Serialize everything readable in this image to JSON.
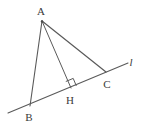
{
  "figure": {
    "type": "euclidean-geometry-diagram",
    "width": 145,
    "height": 132,
    "background_color": "#ffffff",
    "stroke_color": "#5a5a5a",
    "label_color": "#3a3a3a",
    "points": [
      {
        "id": "A",
        "label": "A",
        "x": 42,
        "y": 21,
        "label_x": 41,
        "label_y": 11
      },
      {
        "id": "B",
        "label": "B",
        "x": 30,
        "y": 106,
        "label_x": 29,
        "label_y": 117
      },
      {
        "id": "H",
        "label": "H",
        "x": 71,
        "y": 88,
        "label_x": 70,
        "label_y": 100
      },
      {
        "id": "C",
        "label": "C",
        "x": 106,
        "y": 72,
        "label_x": 107,
        "label_y": 84
      }
    ],
    "line": {
      "id": "l",
      "label": "l",
      "x1": 8,
      "y1": 113,
      "x2": 128,
      "y2": 63,
      "label_x": 131,
      "label_y": 62
    },
    "segments": [
      {
        "id": "AB",
        "from": "A",
        "to": "B",
        "x1": 42,
        "y1": 21,
        "x2": 30,
        "y2": 106
      },
      {
        "id": "AH",
        "from": "A",
        "to": "H",
        "x1": 42,
        "y1": 21,
        "x2": 71,
        "y2": 88
      },
      {
        "id": "AC",
        "from": "A",
        "to": "C",
        "x1": 42,
        "y1": 21,
        "x2": 106,
        "y2": 72
      }
    ],
    "right_angle": {
      "at": "H",
      "size": 8,
      "marker_points": "65.8,81.5 73.2,78.4 76.3,85.8"
    }
  }
}
